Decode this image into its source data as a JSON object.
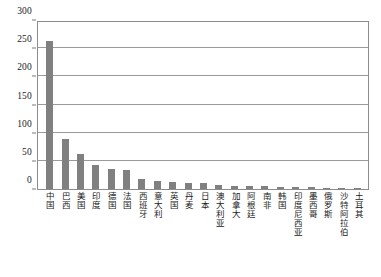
{
  "chart_data": {
    "type": "bar",
    "title": "",
    "xlabel": "",
    "ylabel": "",
    "ylim": [
      0,
      300
    ],
    "y_ticks": [
      0,
      50,
      100,
      150,
      200,
      250,
      300
    ],
    "grid": true,
    "legend": "none",
    "bar_color": "#808080",
    "categories": [
      "中国",
      "巴西",
      "美国",
      "印度",
      "德国",
      "法国",
      "西班牙",
      "意大利",
      "英国",
      "丹麦",
      "日本",
      "澳大利亚",
      "加拿大",
      "阿根廷",
      "南非",
      "韩国",
      "印度尼西亚",
      "墨西哥",
      "俄罗斯",
      "沙特阿拉伯",
      "土耳其"
    ],
    "values": [
      262,
      88,
      62,
      43,
      36,
      33,
      18,
      15,
      12,
      11,
      10,
      7,
      6,
      5,
      5,
      4,
      3,
      3,
      2,
      2,
      1
    ]
  },
  "axis": {
    "y_tick_labels": [
      "0",
      "50",
      "100",
      "150",
      "200",
      "250",
      "300"
    ]
  }
}
